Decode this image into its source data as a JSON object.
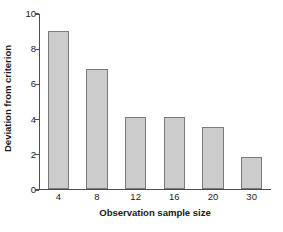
{
  "chart_data": {
    "type": "bar",
    "title": "",
    "subtitle": "",
    "xlabel": "Observation sample size",
    "ylabel": "Deviation from criterion",
    "categories": [
      "4",
      "8",
      "12",
      "16",
      "20",
      "30"
    ],
    "values": [
      9.0,
      6.85,
      4.1,
      4.1,
      3.55,
      1.85
    ],
    "series": [
      {
        "name": "Deviation from criterion",
        "values": [
          9.0,
          6.85,
          4.1,
          4.1,
          3.55,
          1.85
        ]
      }
    ],
    "ylim": [
      0,
      10
    ],
    "yticks": [
      0,
      2,
      4,
      6,
      8,
      10
    ],
    "ytick_labels": [
      "0",
      "2",
      "4",
      "6",
      "8",
      "10"
    ],
    "xtick_labels": [
      "4",
      "8",
      "12",
      "16",
      "20",
      "30"
    ],
    "grid": false,
    "legend": false,
    "legend_position": "none",
    "bar_fill_color": "#cccccc",
    "bar_border_color": "#7a7a7a",
    "axis_color": "#4d4d4d",
    "text_color": "#1a1a1a",
    "background_color": "#ffffff"
  },
  "axes": {
    "y_title": "Deviation from criterion",
    "x_title": "Observation sample size"
  }
}
